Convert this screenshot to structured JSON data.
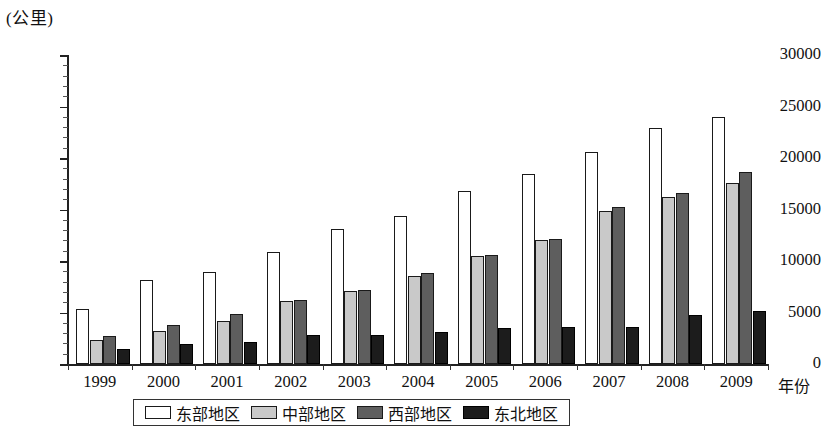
{
  "chart_data": {
    "type": "bar",
    "title": "",
    "subtitle": "",
    "unit_label": "(公里)",
    "ylabel": "(公里)",
    "xlabel": "年份",
    "ylim": [
      0,
      30000
    ],
    "ytick_step": 5000,
    "yticks": [
      "0",
      "5000",
      "10000",
      "15000",
      "20000",
      "25000",
      "30000"
    ],
    "grid": false,
    "legend_position": "bottom",
    "categories": [
      "1999",
      "2000",
      "2001",
      "2002",
      "2003",
      "2004",
      "2005",
      "2006",
      "2007",
      "2008",
      "2009"
    ],
    "series": [
      {
        "name": "东部地区",
        "color": "#ffffff",
        "values": [
          5300,
          8150,
          8950,
          10900,
          13100,
          14400,
          16800,
          18400,
          20600,
          22900,
          24000
        ]
      },
      {
        "name": "中部地区",
        "color": "#c9c9c9",
        "values": [
          2300,
          3250,
          4150,
          6100,
          7050,
          8500,
          10500,
          12000,
          14900,
          16200,
          17600
        ]
      },
      {
        "name": "西部地区",
        "color": "#5e5e5e",
        "values": [
          2700,
          3800,
          4850,
          6200,
          7150,
          8800,
          10600,
          12100,
          15200,
          16600,
          18600
        ]
      },
      {
        "name": "东北地区",
        "color": "#1c1c1c",
        "values": [
          1500,
          1950,
          2150,
          2800,
          2800,
          3150,
          3450,
          3550,
          3600,
          4750,
          5100
        ]
      }
    ]
  },
  "legend": {
    "items": [
      {
        "label": "东部地区",
        "swatch": "white-swatch"
      },
      {
        "label": "中部地区",
        "swatch": "light-gray-swatch"
      },
      {
        "label": "西部地区",
        "swatch": "dark-gray-swatch"
      },
      {
        "label": "东北地区",
        "swatch": "black-swatch"
      }
    ]
  }
}
